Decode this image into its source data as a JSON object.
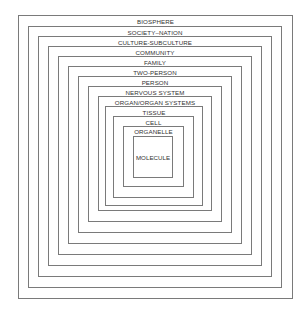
{
  "diagram": {
    "type": "nested-squares",
    "levels": [
      {
        "label": "BIOSPHERE"
      },
      {
        "label": "SOCIETY–NATION"
      },
      {
        "label": "CULTURE-SUBCULTURE"
      },
      {
        "label": "COMMUNITY"
      },
      {
        "label": "FAMILY"
      },
      {
        "label": "TWO-PERSON"
      },
      {
        "label": "PERSON"
      },
      {
        "label": "NERVOUS SYSTEM"
      },
      {
        "label": "ORGAN/ORGAN SYSTEMS"
      },
      {
        "label": "TISSUE"
      },
      {
        "label": "CELL"
      },
      {
        "label": "ORGANELLE"
      },
      {
        "label": "MOLECULE"
      }
    ]
  }
}
